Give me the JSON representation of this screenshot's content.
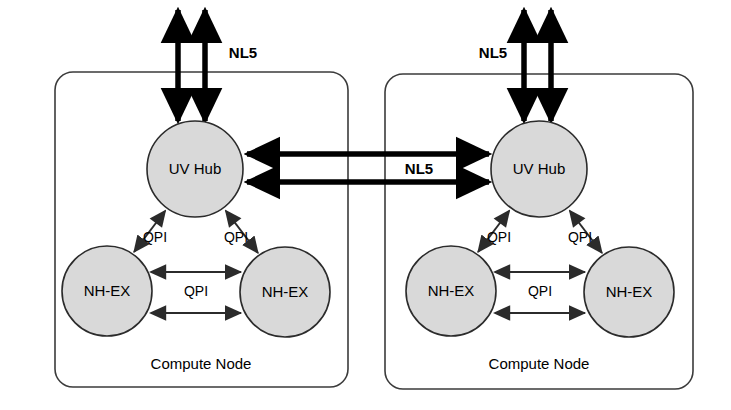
{
  "diagram": {
    "colors": {
      "circle_fill": "#d9d9d9",
      "circle_stroke": "#2b2b2b",
      "box_stroke": "#3b3b3b",
      "thick_arrow": "#000000",
      "thin_arrow": "#2b2b2b",
      "background": "#ffffff"
    },
    "nodes": [
      {
        "id": "node-left",
        "box_label": "Compute Node",
        "chips": [
          {
            "id": "uv-hub-left",
            "label": "UV Hub",
            "cx": 195,
            "cy": 169,
            "r": 48
          },
          {
            "id": "nh-ex-left-a",
            "label": "NH-EX",
            "cx": 107,
            "cy": 291,
            "r": 45
          },
          {
            "id": "nh-ex-left-b",
            "label": "NH-EX",
            "cx": 285,
            "cy": 292,
            "r": 45
          }
        ],
        "box": {
          "x": 55,
          "y": 72,
          "w": 293,
          "h": 315,
          "rx": 18
        }
      },
      {
        "id": "node-right",
        "box_label": "Compute Node",
        "chips": [
          {
            "id": "uv-hub-right",
            "label": "UV Hub",
            "cx": 539,
            "cy": 169,
            "r": 48
          },
          {
            "id": "nh-ex-right-a",
            "label": "NH-EX",
            "cx": 451,
            "cy": 291,
            "r": 45
          },
          {
            "id": "nh-ex-right-b",
            "label": "NH-EX",
            "cx": 629,
            "cy": 292,
            "r": 45
          }
        ],
        "box": {
          "x": 385,
          "y": 74,
          "w": 308,
          "h": 315,
          "rx": 18
        }
      }
    ],
    "links": {
      "nl5_label": "NL5",
      "qpi_label": "QPI",
      "external_top_left": {
        "label": "NL5",
        "label_x": 243,
        "label_y": 54,
        "arrow_xs": [
          178,
          205
        ],
        "y_top": 8,
        "y_bottom": 122
      },
      "external_top_right": {
        "label": "NL5",
        "label_x": 493,
        "label_y": 54,
        "arrow_xs": [
          524,
          551
        ],
        "y_top": 8,
        "y_bottom": 122
      },
      "inter_node": {
        "label": "NL5",
        "label_x": 419,
        "label_y": 170,
        "rows": [
          {
            "y": 154,
            "direction": "both"
          },
          {
            "y": 182,
            "direction": "both"
          }
        ],
        "x_left": 245,
        "x_right": 490
      },
      "qpi_links_left": [
        {
          "label": "QPI",
          "label_x": 155,
          "label_y": 238
        },
        {
          "label": "QPI",
          "label_x": 236,
          "label_y": 238
        },
        {
          "label": "QPI",
          "label_x": 196,
          "label_y": 292
        }
      ],
      "qpi_links_right": [
        {
          "label": "QPI",
          "label_x": 499,
          "label_y": 238
        },
        {
          "label": "QPI",
          "label_x": 580,
          "label_y": 238
        },
        {
          "label": "QPI",
          "label_x": 540,
          "label_y": 292
        }
      ]
    }
  }
}
